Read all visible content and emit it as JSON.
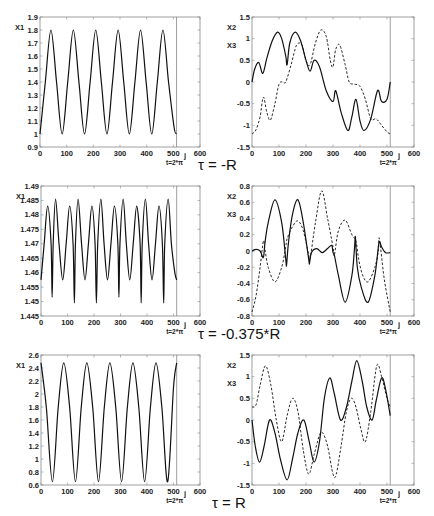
{
  "chart_data": [
    {
      "id": "r1-left",
      "type": "line",
      "title": "",
      "ylabels": [
        "X1"
      ],
      "xlabel": "j",
      "xlim": [
        0,
        600
      ],
      "ylim": [
        0.9,
        1.9
      ],
      "xticks": [
        0,
        100,
        200,
        300,
        400,
        500,
        600
      ],
      "yticks": [
        "0.9",
        "1",
        "1.1",
        "1.2",
        "1.3",
        "1.4",
        "1.5",
        "1.6",
        "1.7",
        "1.8",
        "1.9"
      ],
      "marker": {
        "x": 512,
        "label": "t=2*π"
      },
      "series": [
        {
          "name": "X1",
          "style": "solid",
          "x": [
            0,
            20,
            41,
            62,
            83,
            104,
            125,
            146,
            167,
            188,
            209,
            230,
            251,
            272,
            293,
            314,
            335,
            356,
            377,
            398,
            419,
            440,
            461,
            482,
            503,
            512
          ],
          "y": [
            1.0,
            1.4,
            1.8,
            1.4,
            1.0,
            1.4,
            1.8,
            1.4,
            1.0,
            1.4,
            1.8,
            1.4,
            1.0,
            1.4,
            1.8,
            1.4,
            1.0,
            1.4,
            1.8,
            1.4,
            1.0,
            1.4,
            1.8,
            1.4,
            1.05,
            1.0
          ]
        }
      ]
    },
    {
      "id": "r1-right",
      "type": "line",
      "title": "",
      "ylabels": [
        "X2",
        "X3"
      ],
      "xlabel": "j",
      "xlim": [
        0,
        600
      ],
      "ylim": [
        -1.5,
        1.5
      ],
      "xticks": [
        0,
        100,
        200,
        300,
        400,
        500,
        600
      ],
      "yticks": [
        "-1.5",
        "-1",
        "-0.5",
        "0",
        "0.5",
        "1",
        "1.5"
      ],
      "marker": {
        "x": 512,
        "label": "t=2*π"
      },
      "series": [
        {
          "name": "X2",
          "style": "solid",
          "x": [
            0,
            10,
            25,
            40,
            55,
            75,
            95,
            110,
            125,
            130,
            140,
            160,
            180,
            200,
            215,
            230,
            250,
            275,
            300,
            310,
            330,
            355,
            370,
            385,
            400,
            415,
            440,
            465,
            480,
            500,
            512
          ],
          "y": [
            0.0,
            0.3,
            0.45,
            0.2,
            0.55,
            0.95,
            1.15,
            1.0,
            0.6,
            0.4,
            0.9,
            1.15,
            0.95,
            0.5,
            0.25,
            0.5,
            0.35,
            -0.2,
            -0.45,
            -0.2,
            -0.7,
            -1.12,
            -0.8,
            -0.4,
            -0.9,
            -1.12,
            -0.85,
            -0.2,
            -0.45,
            -0.4,
            0.0
          ]
        }
      ]
    },
    {
      "id": "r1-left-dashed-placeholder",
      "type": "none"
    },
    {
      "id": "r1-right-dashed",
      "type": "line",
      "series_of": "r1-right",
      "series": [
        {
          "name": "X3",
          "style": "dashed",
          "x": [
            0,
            15,
            30,
            42,
            55,
            68,
            85,
            100,
            115,
            125,
            145,
            165,
            185,
            200,
            215,
            235,
            255,
            275,
            290,
            300,
            310,
            325,
            345,
            360,
            380,
            400,
            420,
            440,
            460,
            480,
            500,
            512
          ],
          "y": [
            -1.2,
            -1.1,
            -0.8,
            -0.35,
            -0.7,
            -0.88,
            -0.5,
            -0.05,
            0.0,
            0.0,
            0.4,
            0.85,
            0.85,
            0.5,
            0.4,
            0.9,
            1.2,
            1.05,
            0.5,
            0.35,
            0.75,
            0.85,
            0.4,
            0.0,
            -0.05,
            -0.1,
            -0.4,
            -0.85,
            -0.85,
            -1.0,
            -1.15,
            -1.2
          ]
        }
      ]
    },
    {
      "id": "r2-left",
      "type": "line",
      "title": "",
      "ylabels": [
        "X1"
      ],
      "xlabel": "j",
      "xlim": [
        0,
        600
      ],
      "ylim": [
        1.445,
        1.49
      ],
      "xticks": [
        0,
        100,
        200,
        300,
        400,
        500,
        600
      ],
      "yticks": [
        "1.445",
        "1.45",
        "1.455",
        "1.46",
        "1.465",
        "1.47",
        "1.475",
        "1.48",
        "1.485",
        "1.49"
      ],
      "marker": {
        "x": 512,
        "label": "t=2*π"
      },
      "series": [
        {
          "name": "X1",
          "style": "solid",
          "x": [
            0,
            12,
            25,
            38,
            42,
            46,
            55,
            68,
            82,
            95,
            108,
            121,
            126,
            130,
            140,
            153,
            166,
            179,
            192,
            204,
            209,
            214,
            226,
            238,
            251,
            264,
            277,
            290,
            294,
            298,
            310,
            322,
            335,
            348,
            361,
            374,
            378,
            382,
            394,
            406,
            419,
            432,
            445,
            458,
            463,
            467,
            480,
            492,
            505,
            512
          ],
          "y": [
            1.4575,
            1.47,
            1.483,
            1.47,
            1.4515,
            1.47,
            1.4855,
            1.47,
            1.4575,
            1.47,
            1.483,
            1.47,
            1.4495,
            1.47,
            1.4855,
            1.47,
            1.4575,
            1.47,
            1.483,
            1.47,
            1.4495,
            1.47,
            1.4855,
            1.47,
            1.4575,
            1.47,
            1.483,
            1.47,
            1.4515,
            1.47,
            1.4855,
            1.47,
            1.4575,
            1.47,
            1.483,
            1.47,
            1.4495,
            1.47,
            1.4855,
            1.47,
            1.4575,
            1.47,
            1.483,
            1.47,
            1.4495,
            1.47,
            1.4855,
            1.47,
            1.46,
            1.4575
          ]
        }
      ]
    },
    {
      "id": "r2-right",
      "type": "line",
      "title": "",
      "ylabels": [
        "X2",
        "X3"
      ],
      "xlabel": "j",
      "xlim": [
        0,
        600
      ],
      "ylim": [
        -0.8,
        0.8
      ],
      "xticks": [
        0,
        100,
        200,
        300,
        400,
        500,
        600
      ],
      "yticks": [
        "-0.8",
        "-0.6",
        "-0.4",
        "-0.2",
        "0",
        "0.2",
        "0.4",
        "0.6",
        "0.8"
      ],
      "marker": {
        "x": 512,
        "label": "t=2*π"
      },
      "series": [
        {
          "name": "X2",
          "style": "solid",
          "x": [
            0,
            15,
            30,
            42,
            48,
            60,
            85,
            110,
            125,
            128,
            135,
            150,
            170,
            190,
            210,
            213,
            220,
            240,
            260,
            280,
            295,
            300,
            305,
            320,
            345,
            370,
            380,
            383,
            390,
            405,
            430,
            455,
            468,
            472,
            480,
            495,
            512
          ],
          "y": [
            0.0,
            0.02,
            0.0,
            -0.08,
            0.1,
            0.35,
            0.63,
            0.35,
            -0.1,
            -0.17,
            0.1,
            0.45,
            0.63,
            0.35,
            -0.1,
            -0.15,
            -0.02,
            0.03,
            -0.02,
            0.03,
            0.07,
            -0.02,
            -0.05,
            -0.3,
            -0.63,
            -0.3,
            0.05,
            0.17,
            -0.2,
            -0.45,
            -0.63,
            -0.3,
            0.05,
            0.12,
            0.05,
            -0.02,
            -0.02
          ]
        }
      ]
    },
    {
      "id": "r2-right-dashed",
      "type": "line",
      "series_of": "r2-right",
      "series": [
        {
          "name": "X3",
          "style": "dashed",
          "x": [
            0,
            15,
            30,
            42,
            48,
            60,
            85,
            110,
            125,
            130,
            150,
            170,
            190,
            210,
            215,
            235,
            258,
            280,
            300,
            305,
            320,
            345,
            370,
            385,
            395,
            410,
            430,
            455,
            468,
            472,
            490,
            512
          ],
          "y": [
            -0.75,
            -0.55,
            -0.2,
            0.12,
            0.02,
            -0.2,
            -0.38,
            -0.2,
            0.05,
            0.15,
            0.3,
            0.37,
            0.25,
            -0.05,
            -0.1,
            0.35,
            0.74,
            0.4,
            0.05,
            -0.05,
            0.25,
            0.38,
            0.2,
            0.12,
            -0.1,
            -0.3,
            -0.38,
            -0.2,
            0.0,
            0.15,
            -0.35,
            -0.75
          ]
        }
      ]
    },
    {
      "id": "r3-left",
      "type": "line",
      "title": "",
      "ylabels": [
        "X1"
      ],
      "xlabel": "j",
      "xlim": [
        0,
        600
      ],
      "ylim": [
        0.6,
        2.6
      ],
      "xticks": [
        0,
        100,
        200,
        300,
        400,
        500,
        600
      ],
      "yticks": [
        "0.6",
        "0.8",
        "1",
        "1.2",
        "1.4",
        "1.6",
        "1.8",
        "2",
        "2.2",
        "2.4",
        "2.6"
      ],
      "marker": {
        "x": 512,
        "label": "t=2*π"
      },
      "series": [
        {
          "name": "X1",
          "style": "solid",
          "x": [
            0,
            20,
            43,
            65,
            86,
            108,
            130,
            152,
            173,
            195,
            217,
            239,
            260,
            282,
            304,
            326,
            347,
            369,
            391,
            413,
            434,
            456,
            478,
            500,
            512
          ],
          "y": [
            2.48,
            1.8,
            0.65,
            1.8,
            2.48,
            1.8,
            0.65,
            1.8,
            2.48,
            1.8,
            0.65,
            1.8,
            2.48,
            1.8,
            0.65,
            1.8,
            2.48,
            1.8,
            0.65,
            1.8,
            2.48,
            1.8,
            0.65,
            2.1,
            2.48
          ]
        }
      ]
    },
    {
      "id": "r3-right",
      "type": "line",
      "title": "",
      "ylabels": [
        "X2",
        "X3"
      ],
      "xlabel": "j",
      "xlim": [
        0,
        600
      ],
      "ylim": [
        -1.5,
        1.5
      ],
      "xticks": [
        0,
        100,
        200,
        300,
        400,
        500,
        600
      ],
      "yticks": [
        "-1.5",
        "-1",
        "-0.5",
        "0",
        "0.5",
        "1",
        "1.5"
      ],
      "marker": {
        "x": 512,
        "label": "t=2*π"
      },
      "series": [
        {
          "name": "X2",
          "style": "solid",
          "x": [
            0,
            12,
            28,
            45,
            65,
            85,
            105,
            130,
            150,
            170,
            192,
            212,
            230,
            250,
            268,
            288,
            305,
            328,
            350,
            370,
            388,
            408,
            425,
            445,
            460,
            480,
            495,
            512
          ],
          "y": [
            0.0,
            -0.6,
            -0.97,
            -0.6,
            0.0,
            -0.3,
            -0.9,
            -1.38,
            -0.9,
            -0.3,
            0.0,
            -0.5,
            -0.97,
            -0.5,
            0.5,
            0.97,
            0.6,
            0.0,
            0.3,
            0.9,
            1.37,
            0.9,
            0.3,
            0.0,
            0.45,
            0.97,
            0.7,
            0.1
          ]
        }
      ]
    },
    {
      "id": "r3-right-dashed",
      "type": "line",
      "series_of": "r3-right",
      "series": [
        {
          "name": "X3",
          "style": "dashed",
          "x": [
            0,
            15,
            30,
            50,
            70,
            90,
            110,
            130,
            150,
            170,
            190,
            210,
            230,
            250,
            262,
            280,
            300,
            312,
            330,
            350,
            368,
            385,
            403,
            420,
            440,
            462,
            480,
            500,
            512
          ],
          "y": [
            0.3,
            0.35,
            0.8,
            1.25,
            0.8,
            0.0,
            -0.5,
            0.1,
            0.5,
            0.2,
            -0.7,
            -1.25,
            -0.8,
            -0.35,
            -0.3,
            -0.6,
            -1.25,
            -1.25,
            -0.6,
            0.2,
            0.5,
            0.3,
            -0.2,
            -0.5,
            0.2,
            1.25,
            1.0,
            0.5,
            0.3
          ]
        }
      ]
    }
  ],
  "captions": {
    "row1": "τ = -R",
    "row2": "τ = -0.375*R",
    "row3": "τ = R"
  }
}
